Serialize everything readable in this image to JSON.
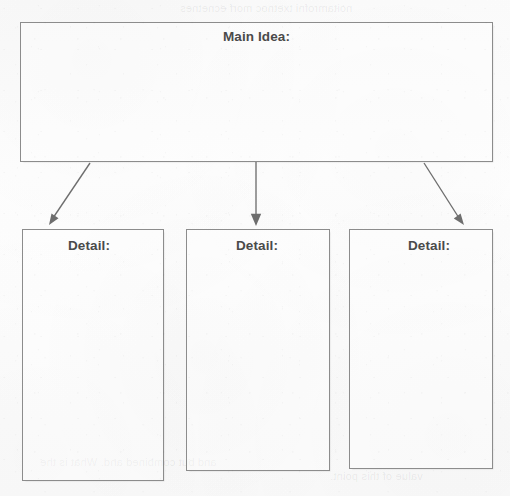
{
  "document": {
    "kind": "graphic-organizer-worksheet",
    "medium": "scanned-paper",
    "paper_color": "#fcfcfc",
    "ink_color": "#8c8c8c",
    "text_color": "#4a4a4a"
  },
  "main_idea": {
    "label": "Main Idea:",
    "value": "",
    "placeholder": ""
  },
  "details": [
    {
      "label": "Detail:",
      "value": "",
      "placeholder": ""
    },
    {
      "label": "Detail:",
      "value": "",
      "placeholder": ""
    },
    {
      "label": "Detail:",
      "value": "",
      "placeholder": ""
    }
  ],
  "connectors": [
    {
      "name": "arrow-to-detail-1",
      "from": [
        90,
        163
      ],
      "to": [
        49,
        224
      ],
      "direction": "down-left"
    },
    {
      "name": "arrow-to-detail-2",
      "from": [
        256,
        162
      ],
      "to": [
        256,
        224
      ],
      "direction": "down"
    },
    {
      "name": "arrow-to-detail-3",
      "from": [
        424,
        163
      ],
      "to": [
        463,
        224
      ],
      "direction": "down-right"
    }
  ],
  "bleed_through": {
    "top": "noitamrofni txetnoc morf ecnetnes",
    "bottom_line_1": "and but combined and. What is the",
    "bottom_line_2": "value of this point."
  }
}
